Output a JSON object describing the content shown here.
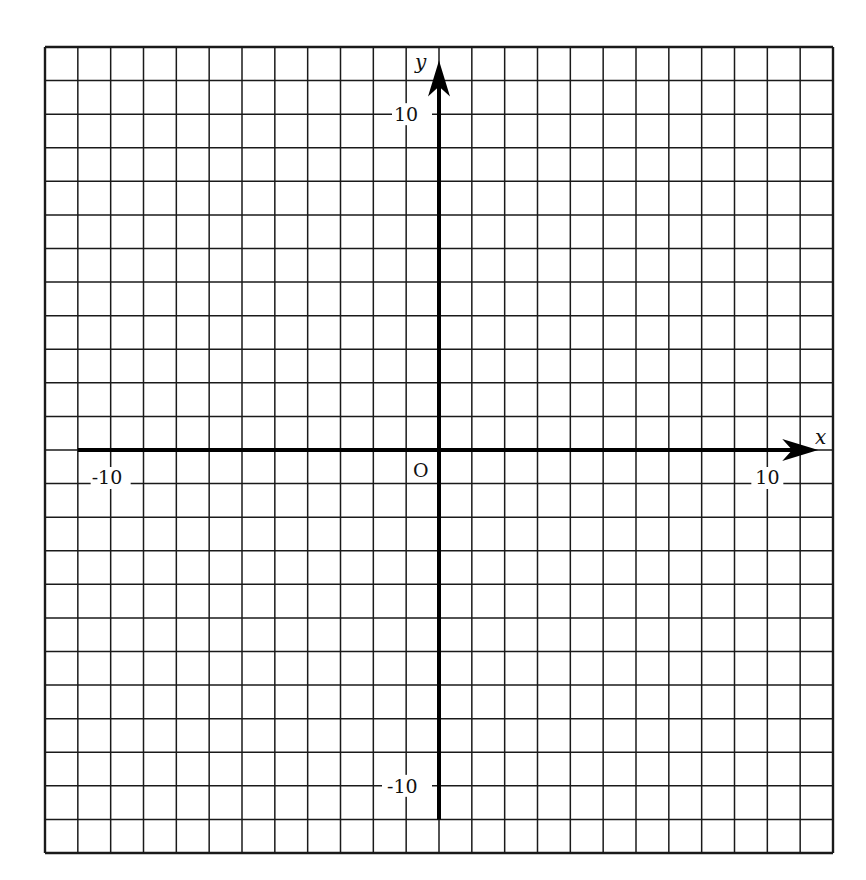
{
  "diagram": {
    "type": "coordinate-grid",
    "grid": {
      "x_min": -12,
      "x_max": 12,
      "y_min": -12,
      "y_max": 12,
      "step": 1,
      "line_color": "#1a1a1a",
      "axis_color": "#000000"
    },
    "axes": {
      "x_label": "x",
      "y_label": "y",
      "origin_label": "O",
      "x_axis_start": -11,
      "y_axis_end": -11
    },
    "tick_labels": {
      "x_neg": "-10",
      "x_pos": "10",
      "y_pos": "10",
      "y_neg": "-10"
    }
  },
  "chart_data": {
    "type": "scatter",
    "title": "",
    "xlabel": "x",
    "ylabel": "y",
    "xlim": [
      -12,
      12
    ],
    "ylim": [
      -12,
      12
    ],
    "grid": true,
    "x_ticks_labeled": [
      -10,
      10
    ],
    "y_ticks_labeled": [
      -10,
      10
    ],
    "origin_label": "O",
    "series": []
  }
}
